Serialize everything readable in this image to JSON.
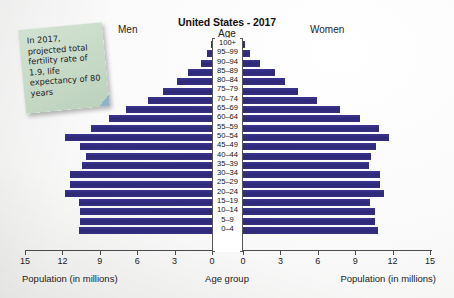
{
  "header": {
    "title": "United States - 2017",
    "age_label": "Age",
    "men_label": "Men",
    "women_label": "Women"
  },
  "note": {
    "text": "In 2017, projected total fertility rate of 1.9, life expectancy of 80 years",
    "color": "#c6d9c6"
  },
  "axis": {
    "left_caption": "Population (in millions)",
    "center_caption": "Age group",
    "right_caption": "Population (in millions)",
    "left_ticks": [
      "15",
      "12",
      "9",
      "6",
      "3",
      "0"
    ],
    "right_ticks": [
      "0",
      "3",
      "6",
      "9",
      "12",
      "15"
    ]
  },
  "colors": {
    "bar": "#2d2877",
    "axis": "#4a4a4a",
    "background": "#f7f7f6"
  },
  "chart_data": {
    "type": "bar",
    "subtype": "population-pyramid",
    "title": "United States - 2017",
    "xlabel": "Population (in millions)",
    "ylabel": "Age group",
    "xlim": [
      0,
      15
    ],
    "grid": false,
    "categories": [
      "100+",
      "95–99",
      "90–94",
      "85–89",
      "80–84",
      "75–79",
      "70–74",
      "65–69",
      "60–64",
      "55–59",
      "50–54",
      "45–49",
      "40–44",
      "35–39",
      "30–34",
      "25–29",
      "20–24",
      "15–19",
      "10–14",
      "5–9",
      "0–4"
    ],
    "series": [
      {
        "name": "Men",
        "side": "left",
        "values": [
          0.05,
          0.4,
          0.9,
          1.9,
          2.8,
          3.9,
          5.1,
          6.9,
          8.3,
          9.7,
          11.8,
          10.6,
          10.1,
          10.4,
          11.4,
          11.4,
          11.8,
          10.7,
          10.6,
          10.6,
          10.7
        ]
      },
      {
        "name": "Women",
        "side": "right",
        "values": [
          0.15,
          0.6,
          1.4,
          2.6,
          3.4,
          4.4,
          5.9,
          7.8,
          9.4,
          10.9,
          11.7,
          10.7,
          10.3,
          10.1,
          11.0,
          11.0,
          11.3,
          10.2,
          10.6,
          10.6,
          10.8
        ]
      }
    ]
  }
}
